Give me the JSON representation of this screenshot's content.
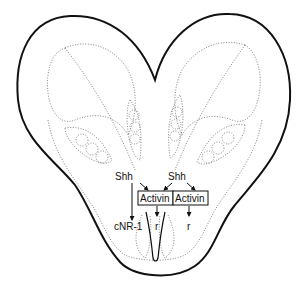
{
  "figure": {
    "type": "neural tube cross-section schematic",
    "labels": {
      "shh_left": "Shh",
      "shh_right": "Shh",
      "activin_left": "Activin",
      "activin_right": "Activin",
      "cnr1": "cNR-1",
      "r_left": "r",
      "r_right": "r"
    },
    "colors": {
      "outline": "#111111",
      "dotted": "#777777",
      "background": "#ffffff"
    }
  }
}
